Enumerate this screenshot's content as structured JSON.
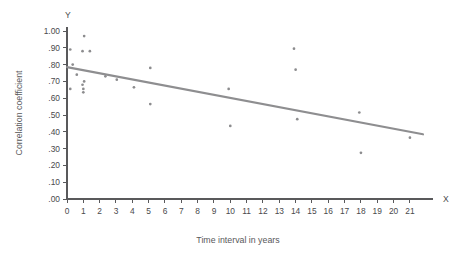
{
  "chart_data": {
    "type": "scatter",
    "title": "",
    "xlabel": "Time interval in years",
    "ylabel": "Correlation coefficient",
    "x_axis_name": "X",
    "y_axis_name": "Y",
    "xlim": [
      0,
      21.8
    ],
    "ylim": [
      0.0,
      1.0
    ],
    "grid": false,
    "legend": "none",
    "x_ticks": [
      0,
      1,
      2,
      3,
      4,
      5,
      6,
      7,
      8,
      9,
      10,
      11,
      12,
      13,
      14,
      15,
      16,
      17,
      18,
      19,
      20,
      21
    ],
    "x_tick_labels": [
      "0",
      "1",
      "2",
      "3",
      "4",
      "5",
      "6",
      "7",
      "8",
      "9",
      "10",
      "11",
      "12",
      "13",
      "14",
      "15",
      "16",
      "17",
      "18",
      "19",
      "20",
      "21"
    ],
    "y_ticks": [
      0.0,
      0.1,
      0.2,
      0.3,
      0.4,
      0.5,
      0.6,
      0.7,
      0.8,
      0.9,
      1.0
    ],
    "y_tick_labels": [
      ".00",
      ".10",
      ".20",
      ".30",
      ".40",
      ".50",
      ".60",
      ".70",
      ".80",
      ".90",
      "1.00"
    ],
    "points": [
      {
        "x": 1.05,
        "y": 0.97
      },
      {
        "x": 0.2,
        "y": 0.89
      },
      {
        "x": 0.95,
        "y": 0.88
      },
      {
        "x": 1.4,
        "y": 0.88
      },
      {
        "x": 0.35,
        "y": 0.8
      },
      {
        "x": 0.6,
        "y": 0.74
      },
      {
        "x": 1.05,
        "y": 0.7
      },
      {
        "x": 2.35,
        "y": 0.73
      },
      {
        "x": 0.95,
        "y": 0.68
      },
      {
        "x": 0.2,
        "y": 0.655
      },
      {
        "x": 1.0,
        "y": 0.655
      },
      {
        "x": 1.0,
        "y": 0.635
      },
      {
        "x": 3.05,
        "y": 0.71
      },
      {
        "x": 4.1,
        "y": 0.665
      },
      {
        "x": 5.1,
        "y": 0.78
      },
      {
        "x": 5.1,
        "y": 0.565
      },
      {
        "x": 9.9,
        "y": 0.655
      },
      {
        "x": 10.0,
        "y": 0.435
      },
      {
        "x": 13.9,
        "y": 0.895
      },
      {
        "x": 14.0,
        "y": 0.77
      },
      {
        "x": 14.1,
        "y": 0.475
      },
      {
        "x": 17.9,
        "y": 0.515
      },
      {
        "x": 18.0,
        "y": 0.275
      },
      {
        "x": 21.0,
        "y": 0.365
      }
    ],
    "trend_line": {
      "x_start": 0.0,
      "y_start": 0.785,
      "x_end": 21.8,
      "y_end": 0.385
    }
  }
}
